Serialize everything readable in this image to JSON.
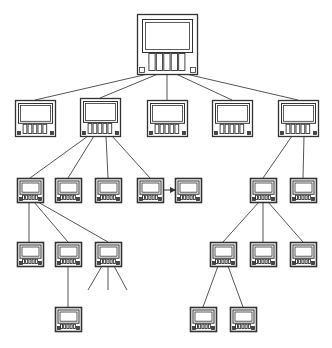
{
  "diagram": {
    "type": "tree",
    "stroke_color": "#333333",
    "line_color": "#555555",
    "nodes": [
      {
        "id": "root",
        "x": 137,
        "y": 14,
        "w": 60,
        "h": 60,
        "size": "large"
      },
      {
        "id": "l1a",
        "x": 15,
        "y": 100,
        "w": 40,
        "h": 36,
        "size": "medium"
      },
      {
        "id": "l1b",
        "x": 80,
        "y": 98,
        "w": 40,
        "h": 38,
        "size": "medium"
      },
      {
        "id": "l1c",
        "x": 147,
        "y": 100,
        "w": 40,
        "h": 36,
        "size": "medium"
      },
      {
        "id": "l1d",
        "x": 212,
        "y": 100,
        "w": 40,
        "h": 36,
        "size": "medium"
      },
      {
        "id": "l1e",
        "x": 278,
        "y": 100,
        "w": 40,
        "h": 36,
        "size": "medium"
      },
      {
        "id": "l2a",
        "x": 17,
        "y": 178,
        "w": 26,
        "h": 24,
        "size": "small"
      },
      {
        "id": "l2b",
        "x": 55,
        "y": 178,
        "w": 26,
        "h": 24,
        "size": "small"
      },
      {
        "id": "l2c",
        "x": 95,
        "y": 178,
        "w": 26,
        "h": 24,
        "size": "small"
      },
      {
        "id": "l2d",
        "x": 137,
        "y": 178,
        "w": 26,
        "h": 24,
        "size": "small"
      },
      {
        "id": "l2e",
        "x": 175,
        "y": 178,
        "w": 26,
        "h": 24,
        "size": "small"
      },
      {
        "id": "l2f",
        "x": 250,
        "y": 178,
        "w": 26,
        "h": 24,
        "size": "small"
      },
      {
        "id": "l2g",
        "x": 290,
        "y": 178,
        "w": 26,
        "h": 24,
        "size": "small"
      },
      {
        "id": "l3a",
        "x": 17,
        "y": 242,
        "w": 26,
        "h": 24,
        "size": "small"
      },
      {
        "id": "l3b",
        "x": 55,
        "y": 242,
        "w": 26,
        "h": 24,
        "size": "small"
      },
      {
        "id": "l3c",
        "x": 95,
        "y": 242,
        "w": 26,
        "h": 24,
        "size": "small"
      },
      {
        "id": "l3d",
        "x": 210,
        "y": 242,
        "w": 26,
        "h": 24,
        "size": "small"
      },
      {
        "id": "l3e",
        "x": 250,
        "y": 242,
        "w": 26,
        "h": 24,
        "size": "small"
      },
      {
        "id": "l3f",
        "x": 290,
        "y": 242,
        "w": 26,
        "h": 24,
        "size": "small"
      },
      {
        "id": "l4a",
        "x": 55,
        "y": 307,
        "w": 26,
        "h": 24,
        "size": "small"
      },
      {
        "id": "l4b",
        "x": 190,
        "y": 307,
        "w": 26,
        "h": 24,
        "size": "small"
      },
      {
        "id": "l4c",
        "x": 230,
        "y": 307,
        "w": 26,
        "h": 24,
        "size": "small"
      }
    ],
    "edges": [
      {
        "from": "root",
        "to": "l1a",
        "fx": 148,
        "fy": 74,
        "tx": 35,
        "ty": 100
      },
      {
        "from": "root",
        "to": "l1b",
        "fx": 158,
        "fy": 74,
        "tx": 100,
        "ty": 98
      },
      {
        "from": "root",
        "to": "l1c",
        "fx": 167,
        "fy": 74,
        "tx": 167,
        "ty": 100
      },
      {
        "from": "root",
        "to": "l1d",
        "fx": 176,
        "fy": 74,
        "tx": 232,
        "ty": 100
      },
      {
        "from": "root",
        "to": "l1e",
        "fx": 186,
        "fy": 74,
        "tx": 298,
        "ty": 100
      },
      {
        "from": "l1b",
        "to": "l2a",
        "fx": 88,
        "fy": 136,
        "tx": 30,
        "ty": 178
      },
      {
        "from": "l1b",
        "to": "l2b",
        "fx": 94,
        "fy": 136,
        "tx": 68,
        "ty": 178
      },
      {
        "from": "l1b",
        "to": "l2c",
        "fx": 106,
        "fy": 136,
        "tx": 108,
        "ty": 178
      },
      {
        "from": "l1b",
        "to": "l2d",
        "fx": 112,
        "fy": 136,
        "tx": 150,
        "ty": 178
      },
      {
        "from": "l1e",
        "to": "l2f",
        "fx": 292,
        "fy": 136,
        "tx": 263,
        "ty": 178
      },
      {
        "from": "l1e",
        "to": "l2g",
        "fx": 304,
        "fy": 136,
        "tx": 303,
        "ty": 178
      },
      {
        "from": "l2a",
        "to": "l3a",
        "fx": 29,
        "fy": 202,
        "tx": 29,
        "ty": 242
      },
      {
        "from": "l2a",
        "to": "l3b",
        "fx": 34,
        "fy": 202,
        "tx": 68,
        "ty": 242
      },
      {
        "from": "l2a",
        "to": "l3c",
        "fx": 38,
        "fy": 202,
        "tx": 108,
        "ty": 242
      },
      {
        "from": "l2f",
        "to": "l3d",
        "fx": 259,
        "fy": 202,
        "tx": 223,
        "ty": 242
      },
      {
        "from": "l2f",
        "to": "l3e",
        "fx": 263,
        "fy": 202,
        "tx": 263,
        "ty": 242
      },
      {
        "from": "l2f",
        "to": "l3f",
        "fx": 268,
        "fy": 202,
        "tx": 303,
        "ty": 242
      },
      {
        "from": "l3b",
        "to": "l4a",
        "fx": 68,
        "fy": 266,
        "tx": 68,
        "ty": 307
      },
      {
        "from": "l3d",
        "to": "l4b",
        "fx": 218,
        "fy": 266,
        "tx": 203,
        "ty": 307
      },
      {
        "from": "l3d",
        "to": "l4c",
        "fx": 228,
        "fy": 266,
        "tx": 243,
        "ty": 307
      },
      {
        "from": "l3c",
        "to": "open",
        "fx": 102,
        "fy": 266,
        "tx": 88,
        "ty": 290
      },
      {
        "from": "l3c",
        "to": "open",
        "fx": 108,
        "fy": 266,
        "tx": 108,
        "ty": 290
      },
      {
        "from": "l3c",
        "to": "open",
        "fx": 114,
        "fy": 266,
        "tx": 127,
        "ty": 290
      }
    ],
    "arrows": [
      {
        "from": "l2d",
        "to": "l2e",
        "fx": 163,
        "fy": 190,
        "tx": 175,
        "ty": 190
      }
    ]
  }
}
